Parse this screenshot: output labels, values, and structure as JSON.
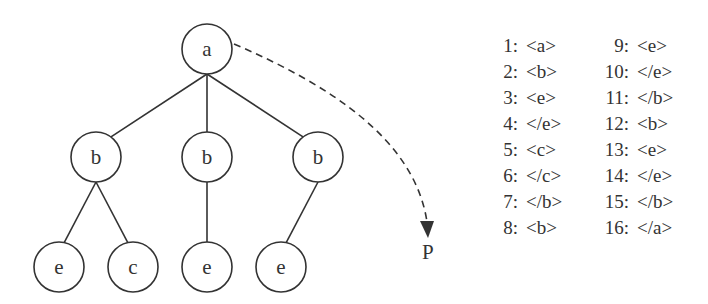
{
  "diagram": {
    "type": "tree",
    "root": "a",
    "nodes": [
      {
        "id": "n1",
        "label": "a",
        "x": 207,
        "y": 49
      },
      {
        "id": "n2",
        "label": "b",
        "x": 96,
        "y": 157
      },
      {
        "id": "n3",
        "label": "b",
        "x": 207,
        "y": 157
      },
      {
        "id": "n4",
        "label": "b",
        "x": 318,
        "y": 157
      },
      {
        "id": "n5",
        "label": "e",
        "x": 59,
        "y": 267
      },
      {
        "id": "n6",
        "label": "c",
        "x": 133,
        "y": 267
      },
      {
        "id": "n7",
        "label": "e",
        "x": 207,
        "y": 267
      },
      {
        "id": "n8",
        "label": "e",
        "x": 281,
        "y": 267
      }
    ],
    "edges": [
      [
        "n1",
        "n2"
      ],
      [
        "n1",
        "n3"
      ],
      [
        "n1",
        "n4"
      ],
      [
        "n2",
        "n5"
      ],
      [
        "n2",
        "n6"
      ],
      [
        "n3",
        "n7"
      ],
      [
        "n4",
        "n8"
      ]
    ],
    "arrow": {
      "from": "n1",
      "style": "dashed",
      "label": "P"
    }
  },
  "listing": {
    "column1": [
      {
        "num": "1:",
        "tag": "<a>"
      },
      {
        "num": "2:",
        "tag": "<b>"
      },
      {
        "num": "3:",
        "tag": "<e>"
      },
      {
        "num": "4:",
        "tag": "</e>"
      },
      {
        "num": "5:",
        "tag": "<c>"
      },
      {
        "num": "6:",
        "tag": "</c>"
      },
      {
        "num": "7:",
        "tag": "</b>"
      },
      {
        "num": "8:",
        "tag": "<b>"
      }
    ],
    "column2": [
      {
        "num": "9:",
        "tag": "<e>"
      },
      {
        "num": "10:",
        "tag": "</e>"
      },
      {
        "num": "11:",
        "tag": "</b>"
      },
      {
        "num": "12:",
        "tag": "<b>"
      },
      {
        "num": "13:",
        "tag": "<e>"
      },
      {
        "num": "14:",
        "tag": "</e>"
      },
      {
        "num": "15:",
        "tag": "</b>"
      },
      {
        "num": "16:",
        "tag": "</a>"
      }
    ]
  }
}
